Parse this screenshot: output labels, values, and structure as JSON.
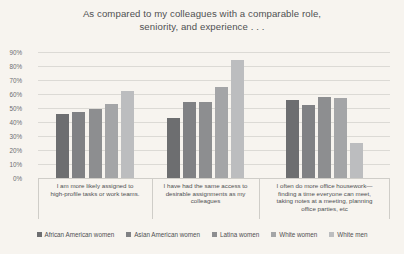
{
  "chart_data": {
    "type": "bar",
    "title_lines": [
      "As compared to my colleagues with a comparable role,",
      "seniority, and experience . . ."
    ],
    "xlabel": "",
    "ylabel": "",
    "ylim": [
      0,
      90
    ],
    "ytick_labels": [
      "90%",
      "80%",
      "70%",
      "60%",
      "50%",
      "40%",
      "30%",
      "20%",
      "10%",
      "0%"
    ],
    "ytick_values": [
      90,
      80,
      70,
      60,
      50,
      40,
      30,
      20,
      10,
      0
    ],
    "grid": true,
    "legend_position": "bottom",
    "categories": [
      "I am more likely assigned to high-profile tasks or work teams.",
      "I have had the same access to desirable assignments as my colleagues",
      "I often do more office housework—finding a time everyone can meet, taking notes at a meeting, planning office parties, etc"
    ],
    "category_lines": [
      [
        "I am more likely assigned to",
        "high-profile tasks or work teams."
      ],
      [
        "I have had the same access to",
        "desirable assignments as my",
        "colleagues"
      ],
      [
        "I often do more office housework—",
        "finding a time everyone can meet,",
        "taking notes at a meeting, planning",
        "office parties, etc"
      ]
    ],
    "series": [
      {
        "name": "African American women",
        "color": "#6d6e70",
        "values": [
          46,
          43,
          56
        ]
      },
      {
        "name": "Asian American women",
        "color": "#808184",
        "values": [
          47,
          54,
          52
        ]
      },
      {
        "name": "Latina women",
        "color": "#8d8e90",
        "values": [
          49,
          54,
          58
        ]
      },
      {
        "name": "White women",
        "color": "#a4a5a7",
        "values": [
          53,
          65,
          57
        ]
      },
      {
        "name": "White men",
        "color": "#bcbdbf",
        "values": [
          62,
          84,
          25
        ]
      }
    ]
  },
  "colors": {
    "background": "#f7f4ef",
    "text": "#4f5052",
    "gridline": "#dcdad5",
    "axis": "#cfcdc8"
  }
}
